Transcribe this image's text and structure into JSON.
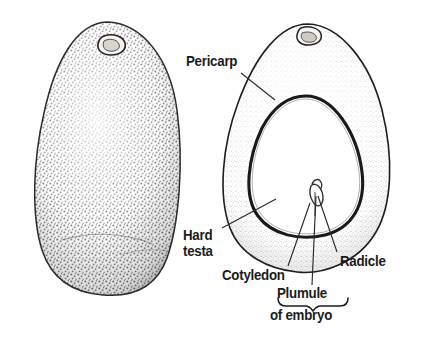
{
  "figure": {
    "kind": "botanical-illustration",
    "background_color": "#ffffff",
    "ink_color": "#1c1c1c"
  },
  "labels": {
    "pericarp": "Pericarp",
    "hard_testa_line1": "Hard",
    "hard_testa_line2": "testa",
    "cotyledon": "Cotyledon",
    "radicle": "Radicle",
    "plumule": "Plumule",
    "of_embryo": "of embryo"
  },
  "parts": {
    "whole_seed_name": "whole-seed",
    "section_name": "seed-longitudinal-section",
    "pericarp_name": "pericarp-layer",
    "testa_name": "hard-testa-layer",
    "cotyledon_name": "cotyledon-body",
    "embryo_name": "embryo",
    "plumule_name": "plumule",
    "radicle_name": "radicle",
    "hilum_name": "hilum-scar"
  },
  "colors": {
    "outline": "#1f1f1f",
    "stipple": "#4a4a4a",
    "leader": "#2a2a2a",
    "brace": "#1c1c1c",
    "pericarp_fill": "#fbfbfa",
    "cotyledon_fill": "#ffffff"
  }
}
